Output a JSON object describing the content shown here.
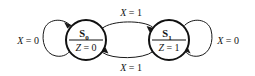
{
  "diagram": {
    "type": "moore-state-diagram",
    "background_color": "#ffffff",
    "line_color": "#1a1a1a",
    "text_color": "#141414",
    "states": [
      {
        "id": "S0",
        "name": "S",
        "subscript": "0",
        "output_label": "Z = 0",
        "output_var": "Z",
        "output_value": "0",
        "cx": 86,
        "cy": 40,
        "r": 20
      },
      {
        "id": "S1",
        "name": "S",
        "subscript": "1",
        "output_label": "Z = 1",
        "output_var": "Z",
        "output_value": "1",
        "cx": 169,
        "cy": 40,
        "r": 20
      }
    ],
    "transitions": [
      {
        "id": "s0-self",
        "from": "S0",
        "to": "S0",
        "label": "X = 0",
        "input_var": "X",
        "input_value": "0",
        "label_x": 28,
        "label_y": 44,
        "kind": "self-loop-left"
      },
      {
        "id": "s0-to-s1",
        "from": "S0",
        "to": "S1",
        "label": "X = 1",
        "input_var": "X",
        "input_value": "1",
        "label_x": 130,
        "label_y": 16,
        "kind": "arc-top"
      },
      {
        "id": "s1-to-s0",
        "from": "S1",
        "to": "S0",
        "label": "X = 1",
        "input_var": "X",
        "input_value": "1",
        "label_x": 130,
        "label_y": 70,
        "kind": "arc-bottom"
      },
      {
        "id": "s1-self",
        "from": "S1",
        "to": "S1",
        "label": "X = 0",
        "input_var": "X",
        "input_value": "0",
        "label_x": 228,
        "label_y": 44,
        "kind": "self-loop-right"
      }
    ]
  }
}
